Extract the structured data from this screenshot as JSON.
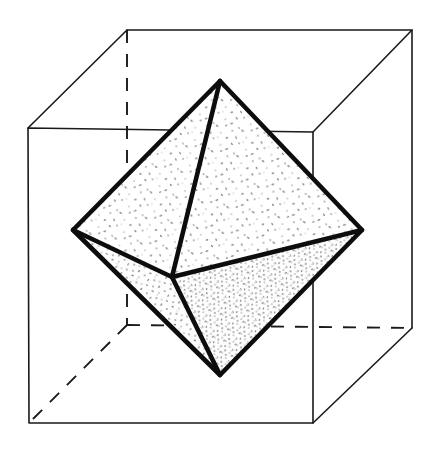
{
  "figure": {
    "title": "Octahedron inscribed in a cube",
    "style": {
      "background": "#ffffff",
      "line_color": "#1a1a1a",
      "octahedron_edge_color": "#0d0d0d",
      "face_light": "#fbfbfb",
      "face_mid": "#f4f4f4",
      "face_dark": "#ededed",
      "stipple_color": "#3a3a3a"
    },
    "canvas": {
      "width": 438,
      "height": 453
    },
    "cube": {
      "label": "cube",
      "vertices": {
        "front_top_left": [
          28,
          128
        ],
        "front_top_right": [
          313,
          132
        ],
        "front_bottom_right": [
          313,
          423
        ],
        "front_bottom_left": [
          29,
          423
        ],
        "back_top_left": [
          127,
          30
        ],
        "back_top_right": [
          412,
          30
        ],
        "back_bottom_right": [
          412,
          328
        ],
        "back_bottom_left": [
          127,
          325
        ]
      },
      "visible_edges": [
        "front_top_left-front_top_right",
        "front_top_right-front_bottom_right",
        "front_bottom_right-front_bottom_left",
        "front_bottom_left-front_top_left",
        "back_top_left-back_top_right",
        "back_top_right-back_bottom_right",
        "front_top_left-back_top_left",
        "front_top_right-back_top_right",
        "front_bottom_right-back_bottom_right"
      ],
      "hidden_edges": [
        "back_top_left-back_bottom_left",
        "back_bottom_left-back_bottom_right",
        "back_bottom_left-front_bottom_left"
      ]
    },
    "octahedron": {
      "label": "octahedron",
      "vertices": {
        "top": [
          220,
          81
        ],
        "bottom": [
          220,
          375
        ],
        "left": [
          73,
          230
        ],
        "right": [
          362,
          230
        ],
        "front": [
          172,
          277
        ],
        "back": [
          268,
          177
        ]
      },
      "visible_faces": [
        {
          "name": "top-left-front",
          "verts": [
            "top",
            "left",
            "front"
          ],
          "shade": "face_light"
        },
        {
          "name": "top-front-right",
          "verts": [
            "top",
            "front",
            "right"
          ],
          "shade": "face_light"
        },
        {
          "name": "bottom-front-left",
          "verts": [
            "bottom",
            "front",
            "left"
          ],
          "shade": "face_mid"
        },
        {
          "name": "bottom-right-front",
          "verts": [
            "bottom",
            "right",
            "front"
          ],
          "shade": "face_dark"
        }
      ],
      "visible_edges": [
        "top-left",
        "top-right",
        "bottom-left",
        "bottom-right",
        "left-front",
        "front-right",
        "top-front",
        "front-bottom"
      ],
      "hidden_edges": [
        "top-back",
        "bottom-back",
        "left-back",
        "back-right"
      ]
    }
  }
}
